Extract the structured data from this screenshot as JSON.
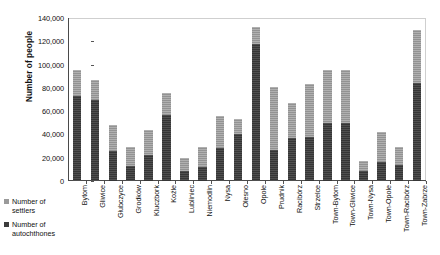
{
  "chart_data": {
    "type": "bar",
    "subtype": "stacked-vertical",
    "title": "",
    "xlabel": "",
    "ylabel": "Number of people",
    "ylim": [
      0,
      140000
    ],
    "ytick_step": 20000,
    "ytick_labels": [
      "140,000",
      "120,000",
      "100,000",
      "80,000",
      "60,000",
      "40,000",
      "20,000",
      "0"
    ],
    "ytick_values": [
      140000,
      120000,
      100000,
      80000,
      60000,
      40000,
      20000,
      0
    ],
    "grid": false,
    "legend_position": "left-bottom",
    "categories": [
      "Bytom",
      "Gliwice",
      "Głubczyce",
      "Grodków",
      "Kluczbork",
      "Koźle",
      "Lubliniec",
      "Niemodlin",
      "Nysa",
      "Olesno",
      "Opole",
      "Prudnik",
      "Racibórz",
      "Strzelce",
      "Town-Bytom",
      "Town-Gliwice",
      "Town-Nysa",
      "Town-Opole",
      "Town-Racibórz",
      "Town-Zabrze"
    ],
    "series": [
      {
        "name": "Number of autochthones",
        "color": "#3c3c3c",
        "values": [
          73000,
          70000,
          26000,
          13000,
          22000,
          57000,
          9000,
          12000,
          28000,
          40000,
          118000,
          27000,
          37000,
          38000,
          50000,
          50000,
          9000,
          16000,
          14000,
          84000
        ]
      },
      {
        "name": "Number of settlers",
        "color": "#9a9a9a",
        "values": [
          22000,
          17000,
          22000,
          16000,
          22000,
          19000,
          11000,
          17000,
          28000,
          13000,
          14000,
          54000,
          30000,
          45000,
          45000,
          45000,
          8000,
          26000,
          15000,
          46000
        ]
      }
    ],
    "totals": [
      95000,
      87000,
      48000,
      29000,
      44000,
      76000,
      20000,
      29000,
      56000,
      53000,
      132000,
      81000,
      67000,
      83000,
      95000,
      95000,
      17000,
      42000,
      29000,
      130000
    ]
  },
  "legend": {
    "items": [
      {
        "label": "Number of settlers",
        "swatch": "settlers"
      },
      {
        "label": "Number of autochthones",
        "swatch": "auto"
      }
    ]
  },
  "axis": {
    "y_title": "Number of people"
  }
}
